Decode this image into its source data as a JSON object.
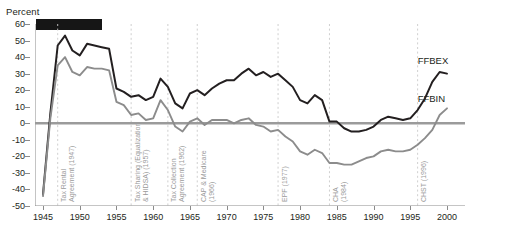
{
  "chart_data": {
    "type": "line",
    "title": "",
    "ylabel": "Percent",
    "xlabel": "",
    "xlim": [
      1945,
      2000
    ],
    "ylim": [
      -50,
      60
    ],
    "ytick_labels": [
      "60",
      "50",
      "40",
      "30",
      "20",
      "10",
      "0",
      "-10",
      "-20",
      "-30",
      "-40",
      "-50"
    ],
    "ytick_values": [
      60,
      50,
      40,
      30,
      20,
      10,
      0,
      -10,
      -20,
      -30,
      -40,
      -50
    ],
    "xtick_labels": [
      "1945",
      "1950",
      "1955",
      "1960",
      "1965",
      "1970",
      "1975",
      "1980",
      "1985",
      "1990",
      "1995",
      "2000"
    ],
    "xtick_values": [
      1945,
      1950,
      1955,
      1960,
      1965,
      1970,
      1975,
      1980,
      1985,
      1990,
      1995,
      2000
    ],
    "grid": "vertical-dashed-at-events",
    "legend_position": "inline-right",
    "x": [
      1945,
      1946,
      1947,
      1948,
      1949,
      1950,
      1951,
      1952,
      1953,
      1954,
      1955,
      1956,
      1957,
      1958,
      1959,
      1960,
      1961,
      1962,
      1963,
      1964,
      1965,
      1966,
      1967,
      1968,
      1969,
      1970,
      1971,
      1972,
      1973,
      1974,
      1975,
      1976,
      1977,
      1978,
      1979,
      1980,
      1981,
      1982,
      1983,
      1984,
      1985,
      1986,
      1987,
      1988,
      1989,
      1990,
      1991,
      1992,
      1993,
      1994,
      1995,
      1996,
      1997,
      1998,
      1999,
      2000
    ],
    "series": [
      {
        "name": "FFBEX",
        "color": "#231f20",
        "values": [
          -43,
          6,
          47,
          53,
          44,
          41,
          48,
          47,
          46,
          45,
          21,
          19,
          16,
          17,
          14,
          16,
          27,
          22,
          12,
          9,
          18,
          20,
          17,
          21,
          24,
          26,
          26,
          30,
          33,
          29,
          31,
          28,
          30,
          26,
          22,
          14,
          12,
          17,
          14,
          1,
          1,
          -3,
          -5,
          -5,
          -4,
          -2,
          2,
          4,
          3,
          2,
          3,
          8,
          15,
          25,
          31,
          30
        ]
      },
      {
        "name": "FFBIN",
        "color": "#8c8c8c",
        "values": [
          -44,
          3,
          35,
          40,
          31,
          29,
          34,
          33,
          33,
          32,
          13,
          11,
          5,
          6,
          2,
          3,
          14,
          8,
          -2,
          -5,
          1,
          3,
          -1,
          2,
          2,
          2,
          0,
          2,
          3,
          -1,
          -2,
          -5,
          -4,
          -8,
          -11,
          -17,
          -19,
          -16,
          -18,
          -24,
          -24,
          -25,
          -25,
          -23,
          -21,
          -20,
          -17,
          -16,
          -17,
          -17,
          -16,
          -13,
          -9,
          -4,
          5,
          9
        ]
      }
    ],
    "annotations": [
      {
        "label_lines": [
          "Tax Rental",
          "Agreement  (1947)"
        ],
        "year": 1947
      },
      {
        "label_lines": [
          "Tax Sharing (Equalization",
          "& HIDSA) (1957)"
        ],
        "year": 1957
      },
      {
        "label_lines": [
          "Tax Collection",
          "Agreement (1962)"
        ],
        "year": 1962
      },
      {
        "label_lines": [
          "CAP & Medicare",
          "(1966)"
        ],
        "year": 1966
      },
      {
        "label_lines": [
          "EPF (1977)"
        ],
        "year": 1977
      },
      {
        "label_lines": [
          "CHA",
          "(1984)"
        ],
        "year": 1984
      },
      {
        "label_lines": [
          "CHST (1996)"
        ],
        "year": 1996
      }
    ],
    "series_labels": [
      {
        "text": "FFBEX",
        "color": "#231f20"
      },
      {
        "text": "FFBIN",
        "color": "#231f20"
      }
    ],
    "redaction_bar": {
      "color": "#161616"
    },
    "zero_line_color": "#9b9b9b",
    "gridline_color": "#c9c9c9"
  }
}
